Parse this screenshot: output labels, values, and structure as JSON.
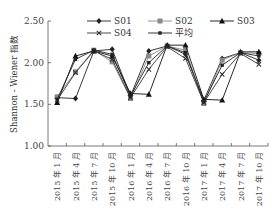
{
  "chart_data": {
    "type": "line",
    "title": "",
    "xlabel": "",
    "ylabel": "Shannon - Wiener 指数",
    "ylim": [
      1.0,
      2.5
    ],
    "yticks": [
      "1.00",
      "1.50",
      "2.00",
      "2.50"
    ],
    "grid": false,
    "legend_position": "top, inside plot",
    "categories": [
      "2015 年 1 月",
      "2015 年 4 月",
      "2015 年 7 月",
      "2015 年 10 月",
      "2016 年 1 月",
      "2016 年 4 月",
      "2016 年 7 月",
      "2016 年 10 月",
      "2017 年 1 月",
      "2017 年 4 月",
      "2017 年 7 月",
      "2017 年 10 月"
    ],
    "series": [
      {
        "name": "S01",
        "marker": "diamond",
        "color": "#222222",
        "values": [
          1.58,
          1.57,
          2.14,
          2.16,
          1.6,
          2.14,
          2.2,
          2.1,
          1.55,
          2.05,
          2.12,
          2.03
        ]
      },
      {
        "name": "S02",
        "marker": "square",
        "color": "#888888",
        "values": [
          1.59,
          1.89,
          2.15,
          2.01,
          1.57,
          2.08,
          2.2,
          2.15,
          1.51,
          2.03,
          2.12,
          2.11
        ]
      },
      {
        "name": "S03",
        "marker": "triangle",
        "color": "#111111",
        "values": [
          1.52,
          2.08,
          2.14,
          2.08,
          1.63,
          1.62,
          2.21,
          2.21,
          1.56,
          1.55,
          2.13,
          2.13
        ]
      },
      {
        "name": "S04",
        "marker": "x",
        "color": "#333333",
        "values": [
          1.55,
          1.88,
          2.14,
          2.04,
          1.58,
          1.92,
          2.19,
          2.05,
          1.52,
          1.86,
          2.11,
          1.98
        ]
      },
      {
        "name": "平均",
        "marker": "small-square",
        "color": "#222222",
        "values": [
          1.56,
          2.04,
          2.15,
          2.1,
          1.6,
          2.0,
          2.2,
          2.12,
          1.53,
          1.97,
          2.12,
          2.08
        ]
      }
    ]
  },
  "legend": {
    "items": [
      "S01",
      "S02",
      "S03",
      "S04",
      "平均"
    ]
  }
}
